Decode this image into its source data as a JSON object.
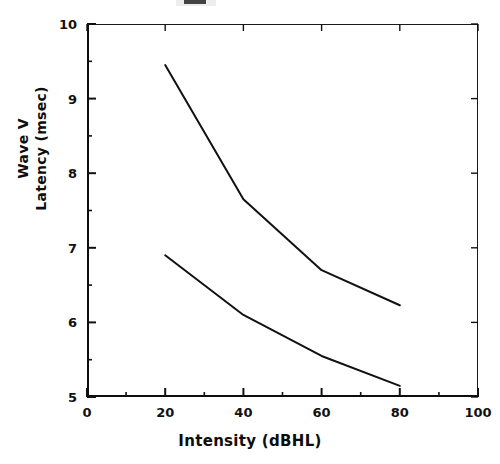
{
  "chart_data": {
    "type": "line",
    "title": "",
    "xlabel": "Intensity (dBHL)",
    "ylabel_line1": "Wave V",
    "ylabel_line2": "Latency (msec)",
    "xlim": [
      0,
      100
    ],
    "ylim": [
      5,
      10
    ],
    "x_major_ticks": [
      0,
      20,
      40,
      60,
      80,
      100
    ],
    "x_tick_labels": [
      "0",
      "20",
      "40",
      "60",
      "80",
      "100"
    ],
    "x_minor_ticks": [
      10,
      30,
      50,
      70,
      90
    ],
    "y_major_ticks": [
      5,
      6,
      7,
      8,
      9,
      10
    ],
    "y_tick_labels": [
      "5",
      "6",
      "7",
      "8",
      "9",
      "10"
    ],
    "y_minor_ticks": [
      5.5,
      6.5,
      7.5,
      8.5,
      9.5
    ],
    "grid": false,
    "legend": false,
    "legend_position": "none",
    "line_color": "#111111",
    "background_color": "#ffffff",
    "x": [
      20,
      40,
      60,
      80
    ],
    "series": [
      {
        "name": "upper-curve",
        "values": [
          9.45,
          7.65,
          6.7,
          6.23
        ]
      },
      {
        "name": "lower-curve",
        "values": [
          6.9,
          6.1,
          5.55,
          5.15
        ]
      }
    ]
  },
  "annotations": {
    "title_remnant": ""
  }
}
